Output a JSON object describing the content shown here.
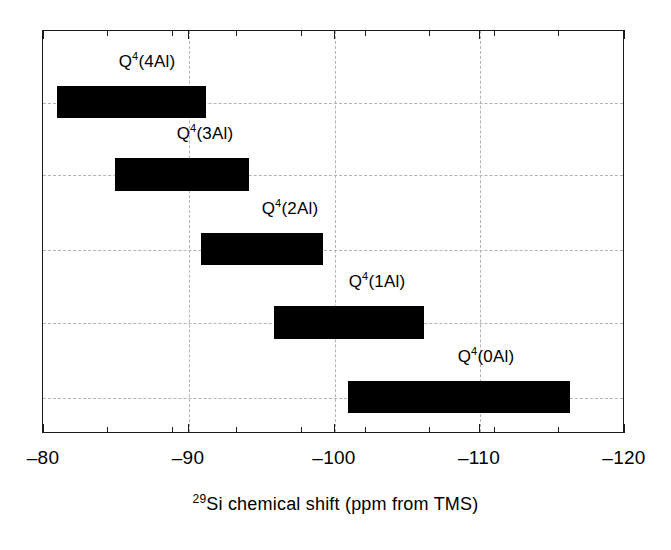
{
  "chart_data": {
    "type": "bar",
    "orientation": "horizontal-range",
    "title": "",
    "subtitle": "",
    "xlabel_parts": {
      "superscript": "29",
      "text": "Si chemical shift (ppm from TMS)"
    },
    "xlabel": "29Si chemical shift (ppm from TMS)",
    "ylabel": "",
    "xlim": [
      -80,
      -120
    ],
    "x_axis_inverted": true,
    "grid": true,
    "grid_style": "dashed",
    "grid_color": "#b3b3b3",
    "legend": "none",
    "bar_color": "#000000",
    "x_major_ticks": [
      -80,
      -90,
      -100,
      -110,
      -120
    ],
    "x_minor_ticks": [
      -85,
      -95,
      -105,
      -115
    ],
    "x_tick_labels": [
      "–80",
      "–90",
      "–100",
      "–110",
      "–120"
    ],
    "categories": [
      "Q4(4Al)",
      "Q4(3Al)",
      "Q4(2Al)",
      "Q4(1Al)",
      "Q4(0Al)"
    ],
    "series": [
      {
        "name": "29Si chemical shift range",
        "ranges": [
          {
            "label_base": "Q",
            "label_sup": "4",
            "label_tail": "(4Al)",
            "start": -81.0,
            "end": -91.2,
            "center": -86.1
          },
          {
            "label_base": "Q",
            "label_sup": "4",
            "label_tail": "(3Al)",
            "start": -85.0,
            "end": -94.2,
            "center": -89.6
          },
          {
            "label_base": "Q",
            "label_sup": "4",
            "label_tail": "(2Al)",
            "start": -90.9,
            "end": -99.3,
            "center": -95.1
          },
          {
            "label_base": "Q",
            "label_sup": "4",
            "label_tail": "(1Al)",
            "start": -95.9,
            "end": -106.3,
            "center": -101.1
          },
          {
            "label_base": "Q",
            "label_sup": "4",
            "label_tail": "(0Al)",
            "start": -101.0,
            "end": -116.3,
            "center": -108.7
          }
        ]
      }
    ]
  },
  "chart": {
    "bars": [
      {
        "name": "bar-q4-4al",
        "label_full": "Q4(4Al)",
        "label_base": "Q",
        "label_sup": "4",
        "label_tail": "(4Al)",
        "left_px": 57,
        "width_px": 149,
        "top_px": 86,
        "height_px": 32,
        "label_center_px": 147,
        "label_top_px": 52
      },
      {
        "name": "bar-q4-3al",
        "label_full": "Q4(3Al)",
        "label_base": "Q",
        "label_sup": "4",
        "label_tail": "(3Al)",
        "left_px": 115,
        "width_px": 134,
        "top_px": 158,
        "height_px": 33,
        "label_center_px": 205,
        "label_top_px": 124
      },
      {
        "name": "bar-q4-2al",
        "label_full": "Q4(2Al)",
        "label_base": "Q",
        "label_sup": "4",
        "label_tail": "(2Al)",
        "left_px": 201,
        "width_px": 122,
        "top_px": 233,
        "height_px": 32,
        "label_center_px": 290,
        "label_top_px": 199
      },
      {
        "name": "bar-q4-1al",
        "label_full": "Q4(1Al)",
        "label_base": "Q",
        "label_sup": "4",
        "label_tail": "(1Al)",
        "left_px": 274,
        "width_px": 150,
        "top_px": 306,
        "height_px": 33,
        "label_center_px": 377,
        "label_top_px": 272
      },
      {
        "name": "bar-q4-0al",
        "label_full": "Q4(0Al)",
        "label_base": "Q",
        "label_sup": "4",
        "label_tail": "(0Al)",
        "left_px": 348,
        "width_px": 222,
        "top_px": 381,
        "height_px": 32,
        "label_center_px": 486,
        "label_top_px": 347
      }
    ],
    "gridlines_v_px": [
      188,
      334,
      479
    ],
    "gridlines_h_px": [
      102,
      174,
      249,
      322,
      397
    ],
    "ticks_major_px": [
      43,
      188,
      334,
      479,
      624
    ],
    "ticks_minor_px": [
      107,
      172,
      236,
      301,
      365,
      429,
      494,
      558
    ],
    "tick_label_positions_px": [
      43,
      188,
      334,
      479,
      624
    ]
  }
}
